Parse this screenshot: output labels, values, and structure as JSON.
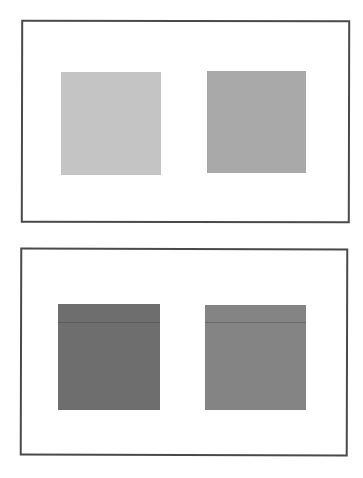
{
  "figure": {
    "panels": [
      {
        "id": "top",
        "swatches": [
          {
            "position": "left",
            "color": "#c4c4c4",
            "x": 61,
            "y": 72,
            "w": 100,
            "h": 103
          },
          {
            "position": "right",
            "color": "#a9a9a9",
            "x": 207,
            "y": 71,
            "w": 99,
            "h": 102
          }
        ]
      },
      {
        "id": "bottom",
        "swatches": [
          {
            "position": "left",
            "color": "#6e6e6e",
            "x": 58,
            "y": 304,
            "w": 102,
            "h": 106
          },
          {
            "position": "right",
            "color": "#848484",
            "x": 205,
            "y": 305,
            "w": 101,
            "h": 105
          }
        ]
      }
    ],
    "border_color": "#4a4a4a",
    "background_color": "#ffffff"
  }
}
